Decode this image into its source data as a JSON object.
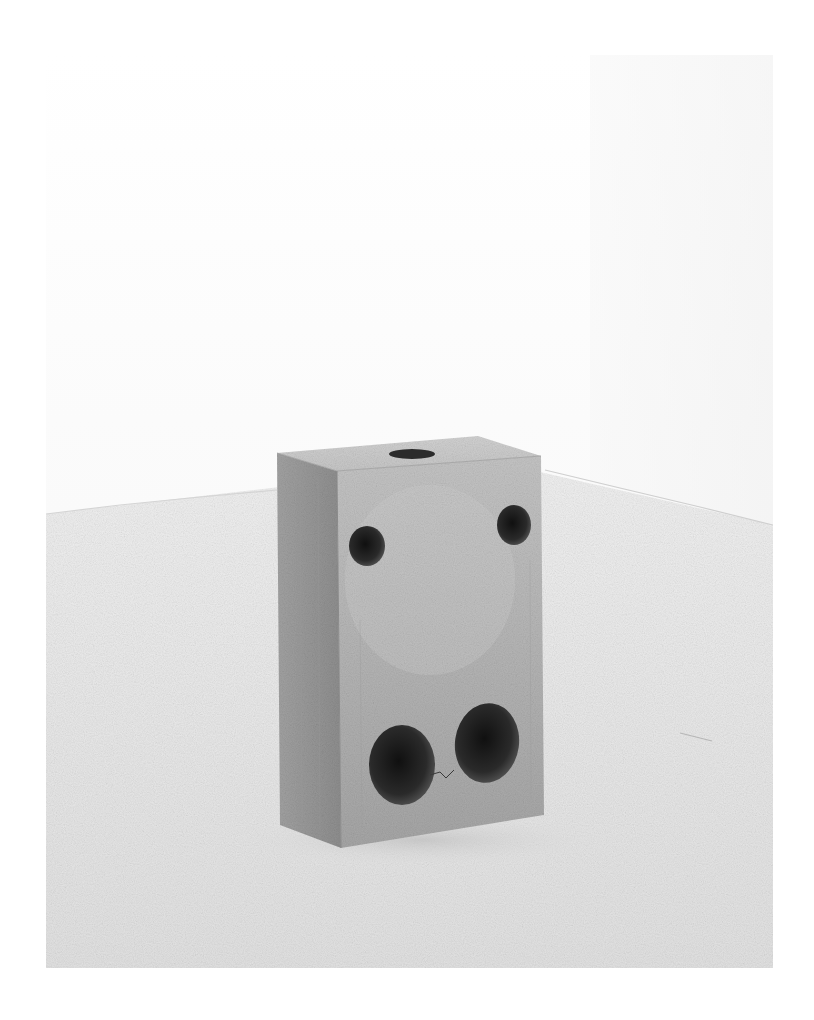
{
  "page": {
    "background": "#ffffff"
  },
  "photo": {
    "subject": "concrete block sculpture in white gallery",
    "bounds": {
      "x": 46,
      "y": 55,
      "width": 727,
      "height": 913
    },
    "colors": {
      "wall": "#fbfbfb",
      "floor": "#e9e9e9",
      "concrete_light": "#c9c9c9",
      "concrete_mid": "#a8a8a8",
      "concrete_dark": "#7c7c7c",
      "hole_dark": "#1c1c1c"
    },
    "sculpture": {
      "faces": [
        "top",
        "left-side",
        "front"
      ],
      "openings": [
        {
          "name": "top-hole",
          "cx": 412,
          "cy": 454,
          "rx": 23,
          "ry": 5
        },
        {
          "name": "upper-left-hole",
          "cx": 367,
          "cy": 546,
          "rx": 18,
          "ry": 20
        },
        {
          "name": "upper-right-hole",
          "cx": 514,
          "cy": 525,
          "rx": 17,
          "ry": 20
        },
        {
          "name": "lower-left-hole",
          "cx": 402,
          "cy": 765,
          "rx": 33,
          "ry": 40
        },
        {
          "name": "lower-right-hole",
          "cx": 487,
          "cy": 743,
          "rx": 32,
          "ry": 40
        }
      ]
    }
  }
}
